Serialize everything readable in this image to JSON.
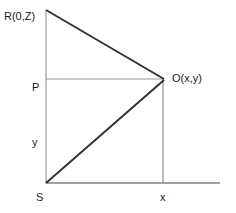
{
  "diagram": {
    "type": "geometry-figure",
    "canvas": {
      "width": 236,
      "height": 213
    },
    "colors": {
      "background": "#ffffff",
      "thick_stroke": "#333333",
      "thin_stroke": "#9a9a9a",
      "axis_stroke": "#808080",
      "text": "#1a1a1a"
    },
    "labels": {
      "apex_top": "R(0,Z)",
      "point_right": "O(x,y)",
      "point_left": "P",
      "side_vertical": "y",
      "origin": "S",
      "side_horizontal": "x"
    },
    "points": {
      "R": {
        "x": 46,
        "y": 10
      },
      "O": {
        "x": 163,
        "y": 79
      },
      "P": {
        "x": 46,
        "y": 79
      },
      "S": {
        "x": 46,
        "y": 183
      },
      "X": {
        "x": 163,
        "y": 183
      },
      "axis_end": {
        "x": 220,
        "y": 183
      }
    },
    "segments": [
      {
        "name": "hypotenuse-R-to-O",
        "from": "R",
        "to": "O",
        "weight": "thick"
      },
      {
        "name": "diagonal-S-to-O",
        "from": "S",
        "to": "O",
        "weight": "thick"
      },
      {
        "name": "vertical-R-to-S",
        "from": "R",
        "to": "S",
        "weight": "thin"
      },
      {
        "name": "horizontal-P-to-O",
        "from": "P",
        "to": "O",
        "weight": "thin"
      },
      {
        "name": "vertical-O-to-X",
        "from": "O",
        "to": "X",
        "weight": "thin"
      },
      {
        "name": "baseline-S-to-axis-end",
        "from": "S",
        "to": "axis_end",
        "weight": "axis"
      }
    ]
  }
}
